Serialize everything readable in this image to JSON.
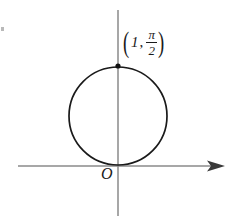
{
  "figure": {
    "title": "",
    "background_color": "#ffffff",
    "axis_color": "#8a8a8a",
    "curve_color": "#1a1a1a",
    "point_color": "#111111"
  },
  "labels": {
    "origin": "O",
    "point_open_paren": "(",
    "point_r": "1",
    "point_comma": ",",
    "point_theta_numerator": "π",
    "point_theta_denominator": "2",
    "point_close_paren": ")"
  },
  "chart_data": {
    "type": "line",
    "title": "",
    "subtitle": "",
    "xlabel": "",
    "ylabel": "",
    "grid": false,
    "legend": null,
    "coordinate_system": "polar-curve-drawn-on-cartesian-axes",
    "curve": {
      "name": "r = sin(theta) circle",
      "shape": "circle",
      "center": [
        118,
        116
      ],
      "radius": 49,
      "tangent_to_x_axis_at_origin": true,
      "stroke_width": 1.7
    },
    "points": [
      {
        "label": "(1, π/2)",
        "r": 1,
        "theta": "π/2",
        "pixel": [
          118,
          66
        ],
        "marker": "dot",
        "marker_radius": 2.6
      }
    ],
    "axes": {
      "x_axis": {
        "y_pixel": 166,
        "x_start": 18,
        "x_end": 225,
        "arrow": "right",
        "label": ""
      },
      "y_axis": {
        "x_pixel": 118,
        "y_start": 10,
        "y_end": 216,
        "arrow": "none",
        "label": ""
      },
      "origin_pixel": [
        118,
        166
      ]
    }
  }
}
